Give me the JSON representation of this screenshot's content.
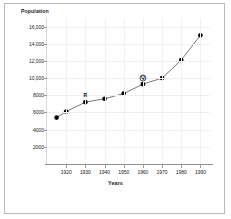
{
  "figure": {
    "background_color": "#ffffff",
    "border_color": "#b9b9b9"
  },
  "chart_data": {
    "type": "line",
    "title": "",
    "ylabel": "Population",
    "xlabel": "Years",
    "x": [
      1915,
      1920,
      1930,
      1940,
      1950,
      1960,
      1970,
      1980,
      1990
    ],
    "values": [
      5400,
      6100,
      7200,
      7600,
      8200,
      9300,
      10000,
      12100,
      15000
    ],
    "series": [
      {
        "name": "Population",
        "values": [
          5400,
          6100,
          7200,
          7600,
          8200,
          9300,
          10000,
          12100,
          15000
        ]
      }
    ],
    "xlim": [
      1910,
      1995
    ],
    "ylim": [
      0,
      17000
    ],
    "xticks": [
      1920,
      1930,
      1940,
      1950,
      1960,
      1970,
      1980,
      1990
    ],
    "xtick_labels": [
      "1920",
      "1930",
      "1940",
      "1950",
      "1960",
      "1970",
      "1980",
      "1990"
    ],
    "yticks": [
      2000,
      4000,
      6000,
      8000,
      10000,
      12000,
      14000,
      16000
    ],
    "ytick_labels": [
      "2000",
      "4000",
      "6000",
      "8000",
      "10,000",
      "12,000",
      "14,000",
      "16,000"
    ],
    "grid": true,
    "legend": false,
    "marker": "filled-circle",
    "marker_color": "#000000",
    "line_color": "#555555",
    "annotations": [
      {
        "label": "R",
        "x": 1930,
        "y": 7200,
        "style": "plain"
      },
      {
        "label": "Q",
        "x": 1960,
        "y": 9300,
        "style": "circled"
      }
    ]
  }
}
